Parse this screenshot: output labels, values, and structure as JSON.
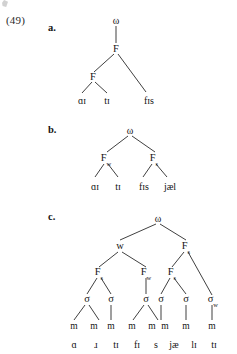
{
  "example_number": "(49)",
  "items": [
    {
      "label": "a.",
      "root": "ω",
      "nodes": [
        "ω",
        "F",
        "F"
      ],
      "terminals": [
        "ɑɪ",
        "tɪ",
        "fɪs"
      ],
      "description": "omega dominates F which branches into F and fɪs; inner F branches into ɑɪ and tɪ"
    },
    {
      "label": "b.",
      "root": "ω",
      "feet": [
        {
          "label": "F",
          "subscript": "w"
        },
        {
          "label": "F",
          "subscript": "s"
        }
      ],
      "terminals": [
        "ɑɪ",
        "tɪ",
        "fɪs",
        "jæl"
      ],
      "description": "omega branches into Fw and Fs; Fw dominates ɑɪ tɪ; Fs dominates fɪs jæl"
    },
    {
      "label": "c.",
      "root": "ω",
      "level2": [
        {
          "label": "w",
          "subscript": ""
        },
        {
          "label": "F",
          "subscript": "s"
        }
      ],
      "feet": [
        {
          "label": "F",
          "subscript": "s"
        },
        {
          "label": "F",
          "subscript": "w"
        },
        {
          "label": "F",
          "subscript": "s"
        }
      ],
      "syllables": [
        {
          "label": "σ",
          "subscript": ""
        },
        {
          "label": "σ",
          "subscript": ""
        },
        {
          "label": "σ",
          "subscript": ""
        },
        {
          "label": "σ",
          "subscript": ""
        },
        {
          "label": "σ",
          "subscript": ""
        },
        {
          "label": "σ",
          "subscript": "w"
        }
      ],
      "moras": [
        "m",
        "m",
        "m",
        "m",
        "m",
        "m",
        "m",
        "m",
        "m"
      ],
      "terminals": [
        "ɑ",
        "ɹ",
        "tɪ",
        "fɪ",
        "s",
        "jæ",
        "lɪ",
        "tɪ"
      ],
      "description": "omega branches into w and Fs; six syllables with nine moras"
    }
  ],
  "colors": {
    "ink": "#141414",
    "line": "#1d1d1d",
    "page": "#ffffff"
  }
}
